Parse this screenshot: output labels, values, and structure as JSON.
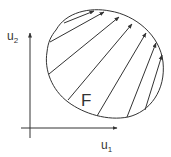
{
  "diagram": {
    "y_axis_label": "u",
    "y_axis_sub": "2",
    "x_axis_label": "u",
    "x_axis_sub": "1",
    "region_label": "F",
    "stroke_color": "#333333",
    "background": "#ffffff",
    "arrows": [
      {
        "x1": 50,
        "y1": 42,
        "x2": 104,
        "y2": 12
      },
      {
        "x1": 64,
        "y1": 23,
        "x2": 94,
        "y2": 11
      },
      {
        "x1": 49,
        "y1": 74,
        "x2": 119,
        "y2": 17
      },
      {
        "x1": 68,
        "y1": 100,
        "x2": 132,
        "y2": 24
      },
      {
        "x1": 97,
        "y1": 116,
        "x2": 146,
        "y2": 33
      },
      {
        "x1": 127,
        "y1": 117,
        "x2": 156,
        "y2": 43
      },
      {
        "x1": 145,
        "y1": 110,
        "x2": 162,
        "y2": 55
      }
    ]
  }
}
